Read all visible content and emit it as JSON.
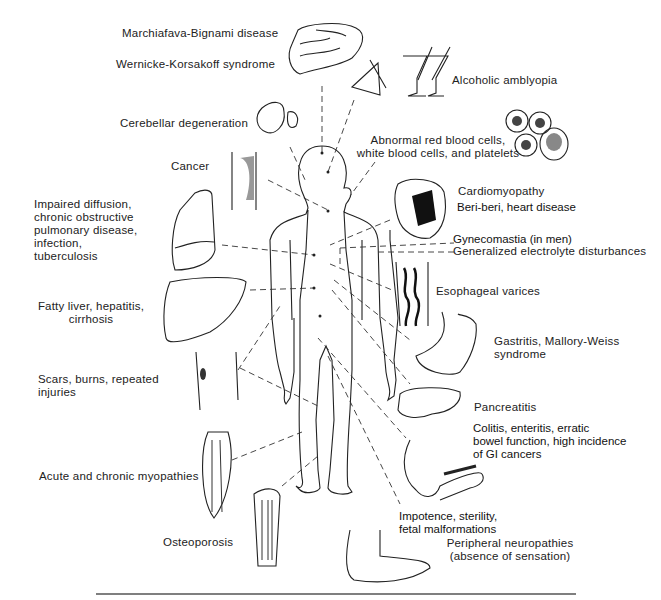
{
  "figure": {
    "type": "medical illustration",
    "labels": {
      "marchiafava": "Marchiafava-Bignami disease",
      "wernicke": "Wernicke-Korsakoff syndrome",
      "cerebellar": "Cerebellar degeneration",
      "cancer": "Cancer",
      "lung": [
        "Impaired diffusion,",
        "chronic obstructive",
        "pulmonary disease,",
        "infection,",
        "tuberculosis"
      ],
      "liver": [
        "Fatty liver, hepatitis,",
        "cirrhosis"
      ],
      "scars": [
        "Scars, burns, repeated",
        "injuries"
      ],
      "myopathies": "Acute and chronic myopathies",
      "osteoporosis": "Osteoporosis",
      "amblyopia": "Alcoholic amblyopia",
      "blood": [
        "Abnormal red blood cells,",
        "white blood cells, and platelets"
      ],
      "cardiomyopathy": "Cardiomyopathy",
      "beriberi": "Beri-beri, heart disease",
      "gynecomastia": "Gynecomastia (in men)",
      "electrolyte": "Generalized electrolyte disturbances",
      "varices": "Esophageal varices",
      "gastritis": [
        "Gastritis, Mallory-Weiss",
        "syndrome"
      ],
      "pancreatitis": "Pancreatitis",
      "colitis": [
        "Colitis, enteritis, erratic",
        "bowel function, high incidence",
        "of GI cancers"
      ],
      "impotence": [
        "Impotence, sterility,",
        "fetal malformations"
      ],
      "neuropathies": [
        "Peripheral neuropathies",
        "(absence of sensation)"
      ]
    },
    "illustrations": [
      "brain",
      "eye",
      "cocktail-glasses",
      "cerebellum",
      "blood-cells",
      "esophagus-tumor",
      "heart",
      "lung",
      "esophageal-varices",
      "liver",
      "stomach",
      "skin-scars",
      "pancreas",
      "muscle",
      "intestine",
      "bone",
      "foot",
      "human-figure"
    ]
  }
}
